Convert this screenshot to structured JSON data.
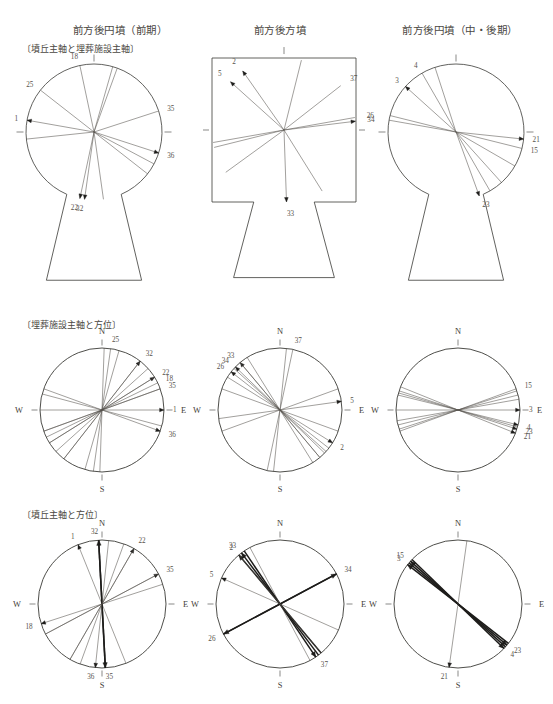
{
  "figure": {
    "columns": [
      {
        "id": "col-a",
        "title": "前方後円墳（前期）"
      },
      {
        "id": "col-b",
        "title": "前方後方墳"
      },
      {
        "id": "col-c",
        "title": "前方後円墳（中・後期）"
      }
    ],
    "rows": [
      {
        "id": "row-1",
        "subtitle": "〔墳丘主軸と埋葬施設主軸〕"
      },
      {
        "id": "row-2",
        "subtitle": "〔埋葬施設主軸と方位〕"
      },
      {
        "id": "row-3",
        "subtitle": "〔墳丘主軸と方位〕"
      }
    ],
    "compass": {
      "north": "N",
      "south": "S",
      "east": "E",
      "west": "W"
    },
    "colors": {
      "ink": "#3a3a36",
      "line": "#54514b",
      "heavy": "#1d1c1a",
      "label": "#57534c"
    }
  },
  "chart_data": [
    {
      "id": "r1c1",
      "type": "scatter",
      "plot": "rose-keyhole",
      "title": "前方後円墳（前期）",
      "subtitle": "〔墳丘主軸と埋葬施設主軸〕",
      "shape": "keyhole",
      "angle_units": "degrees clockwise from up (mound axis direction)",
      "rays": [
        {
          "label": "18",
          "angle": -12,
          "arrow": false
        },
        {
          "label": "25",
          "angle": -52,
          "arrow": false
        },
        {
          "label": "1",
          "angle": -80,
          "arrow": true
        },
        {
          "label": "35",
          "angle": 72,
          "arrow": false
        },
        {
          "label": "36",
          "angle": 108,
          "arrow": true
        },
        {
          "label": "22",
          "angle": 192,
          "arrow": true
        },
        {
          "label": "32",
          "angle": 188,
          "arrow": true
        },
        {
          "label": "",
          "angle": 16,
          "arrow": false
        },
        {
          "label": "",
          "angle": 20,
          "arrow": false
        },
        {
          "label": "",
          "angle": 118,
          "arrow": false
        },
        {
          "label": "",
          "angle": 172,
          "arrow": false
        },
        {
          "label": "",
          "angle": -96,
          "arrow": false
        },
        {
          "label": "",
          "angle": 128,
          "arrow": false
        }
      ]
    },
    {
      "id": "r1c2",
      "type": "scatter",
      "plot": "rose-keyhole",
      "title": "前方後方墳",
      "subtitle": "〔墳丘主軸と埋葬施設主軸〕",
      "shape": "square-keyhole",
      "rays": [
        {
          "label": "2",
          "angle": -35,
          "arrow": true
        },
        {
          "label": "5",
          "angle": -48,
          "arrow": true
        },
        {
          "label": "37",
          "angle": 52,
          "arrow": false
        },
        {
          "label": "26",
          "angle": 80,
          "arrow": false
        },
        {
          "label": "34",
          "angle": 83,
          "arrow": true
        },
        {
          "label": "33",
          "angle": 178,
          "arrow": true
        },
        {
          "label": "",
          "angle": 14,
          "arrow": false
        },
        {
          "label": "",
          "angle": 148,
          "arrow": false
        },
        {
          "label": "",
          "angle": -100,
          "arrow": false
        },
        {
          "label": "",
          "angle": -104,
          "arrow": false
        },
        {
          "label": "",
          "angle": -126,
          "arrow": false
        }
      ]
    },
    {
      "id": "r1c3",
      "type": "scatter",
      "plot": "rose-keyhole",
      "title": "前方後円墳（中・後期）",
      "subtitle": "〔墳丘主軸と埋葬施設主軸〕",
      "shape": "keyhole",
      "rays": [
        {
          "label": "4",
          "angle": -30,
          "arrow": false
        },
        {
          "label": "3",
          "angle": -48,
          "arrow": true
        },
        {
          "label": "21",
          "angle": 96,
          "arrow": true
        },
        {
          "label": "15",
          "angle": 104,
          "arrow": false
        },
        {
          "label": "23",
          "angle": 160,
          "arrow": true
        },
        {
          "label": "",
          "angle": -18,
          "arrow": false
        },
        {
          "label": "",
          "angle": -76,
          "arrow": false
        },
        {
          "label": "",
          "angle": -80,
          "arrow": false
        },
        {
          "label": "",
          "angle": 120,
          "arrow": false
        },
        {
          "label": "",
          "angle": 138,
          "arrow": false
        },
        {
          "label": "",
          "angle": 150,
          "arrow": false
        }
      ]
    },
    {
      "id": "r2c1",
      "type": "scatter",
      "plot": "rose-compass",
      "title": "前方後円墳（前期）",
      "subtitle": "〔埋葬施設主軸と方位〕",
      "shape": "circle",
      "angle_units": "degrees clockwise from North",
      "rays": [
        {
          "label": "25",
          "angle": 8,
          "arrow": false
        },
        {
          "label": "32",
          "angle": 38,
          "arrow": true
        },
        {
          "label": "22",
          "angle": 58,
          "arrow": true
        },
        {
          "label": "18",
          "angle": 64,
          "arrow": false
        },
        {
          "label": "35",
          "angle": 70,
          "arrow": false
        },
        {
          "label": "1",
          "angle": 90,
          "arrow": true
        },
        {
          "label": "36",
          "angle": 110,
          "arrow": true
        },
        {
          "label": "",
          "angle": 182,
          "arrow": false
        },
        {
          "label": "",
          "angle": 196,
          "arrow": false
        },
        {
          "label": "",
          "angle": 218,
          "arrow": false
        },
        {
          "label": "",
          "angle": 228,
          "arrow": false
        },
        {
          "label": "",
          "angle": 238,
          "arrow": false
        },
        {
          "label": "",
          "angle": 250,
          "arrow": false
        },
        {
          "label": "",
          "angle": 285,
          "arrow": false
        }
      ]
    },
    {
      "id": "r2c2",
      "type": "scatter",
      "plot": "rose-compass",
      "title": "前方後方墳",
      "subtitle": "〔埋葬施設主軸と方位〕",
      "shape": "circle",
      "rays": [
        {
          "label": "26",
          "angle": -52,
          "arrow": true
        },
        {
          "label": "34",
          "angle": -46,
          "arrow": true
        },
        {
          "label": "33",
          "angle": -40,
          "arrow": true
        },
        {
          "label": "37",
          "angle": 12,
          "arrow": false
        },
        {
          "label": "5",
          "angle": 82,
          "arrow": true
        },
        {
          "label": "2",
          "angle": 122,
          "arrow": true
        },
        {
          "label": "",
          "angle": 132,
          "arrow": false
        },
        {
          "label": "",
          "angle": 140,
          "arrow": false
        },
        {
          "label": "",
          "angle": 148,
          "arrow": false
        },
        {
          "label": "",
          "angle": 186,
          "arrow": false
        },
        {
          "label": "",
          "angle": 250,
          "arrow": false
        },
        {
          "label": "",
          "angle": 290,
          "arrow": false
        }
      ]
    },
    {
      "id": "r2c3",
      "type": "scatter",
      "plot": "rose-compass",
      "title": "前方後円墳（中・後期）",
      "subtitle": "〔埋葬施設主軸と方位〕",
      "shape": "circle",
      "rays": [
        {
          "label": "15",
          "angle": 70,
          "arrow": false
        },
        {
          "label": "3",
          "angle": 90,
          "arrow": true
        },
        {
          "label": "4",
          "angle": 104,
          "arrow": true
        },
        {
          "label": "23",
          "angle": 108,
          "arrow": true
        },
        {
          "label": "21",
          "angle": 112,
          "arrow": true
        },
        {
          "label": "",
          "angle": 252,
          "arrow": false
        },
        {
          "label": "",
          "angle": 256,
          "arrow": false
        },
        {
          "label": "",
          "angle": 260,
          "arrow": false
        },
        {
          "label": "",
          "angle": 286,
          "arrow": false
        }
      ]
    },
    {
      "id": "r3c1",
      "type": "scatter",
      "plot": "rose-compass",
      "title": "前方後円墳（前期）",
      "subtitle": "〔墳丘主軸と方位〕",
      "shape": "circle",
      "rays": [
        {
          "label": "1",
          "angle": -22,
          "arrow": true
        },
        {
          "label": "32",
          "angle": -3,
          "arrow": true,
          "heavy": true
        },
        {
          "label": "22",
          "angle": 30,
          "arrow": true
        },
        {
          "label": "35",
          "angle": 62,
          "arrow": true
        },
        {
          "label": "18",
          "angle": -108,
          "arrow": true
        },
        {
          "label": "35",
          "angle": 177,
          "arrow": true,
          "heavy": true
        },
        {
          "label": "36",
          "angle": 186,
          "arrow": true
        },
        {
          "label": "",
          "angle": 200,
          "arrow": false
        },
        {
          "label": "",
          "angle": 210,
          "arrow": false
        },
        {
          "label": "",
          "angle": 242,
          "arrow": false
        }
      ]
    },
    {
      "id": "r3c2",
      "type": "scatter",
      "plot": "rose-compass",
      "title": "前方後方墳",
      "subtitle": "〔墳丘主軸と方位〕",
      "shape": "circle",
      "rays": [
        {
          "label": "33",
          "angle": -37,
          "arrow": true,
          "heavy": true
        },
        {
          "label": "2",
          "angle": -40,
          "arrow": true,
          "heavy": true
        },
        {
          "label": "5",
          "angle": -66,
          "arrow": true
        },
        {
          "label": "26",
          "angle": -118,
          "arrow": true,
          "heavy": true
        },
        {
          "label": "34",
          "angle": 62,
          "arrow": true,
          "heavy": true
        },
        {
          "label": "37",
          "angle": 146,
          "arrow": true,
          "heavy": true
        },
        {
          "label": "",
          "angle": 140,
          "arrow": false
        },
        {
          "label": "",
          "angle": 152,
          "arrow": false
        }
      ]
    },
    {
      "id": "r3c3",
      "type": "scatter",
      "plot": "rose-compass",
      "title": "前方後円墳（中・後期）",
      "subtitle": "〔墳丘主軸と方位〕",
      "shape": "circle",
      "rays": [
        {
          "label": "15",
          "angle": -48,
          "arrow": true,
          "heavy": true
        },
        {
          "label": "3",
          "angle": -52,
          "arrow": true,
          "heavy": true
        },
        {
          "label": "23",
          "angle": 130,
          "arrow": true,
          "heavy": true
        },
        {
          "label": "4",
          "angle": 134,
          "arrow": true,
          "heavy": true
        },
        {
          "label": "21",
          "angle": 188,
          "arrow": true
        }
      ]
    }
  ]
}
